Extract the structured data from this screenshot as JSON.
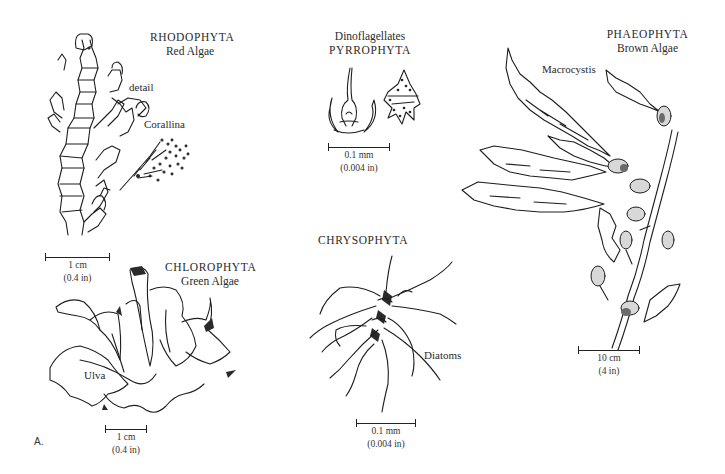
{
  "figure": {
    "panel_letter": "A.",
    "groups": [
      {
        "id": "rhodophyta",
        "division": "RHODOPHYTA",
        "common_name": "Red Algae",
        "annotations": [
          "detail",
          "Corallina"
        ],
        "scale_bar": {
          "metric": "1 cm",
          "imperial": "(0.4 in)"
        }
      },
      {
        "id": "pyrrophyta",
        "division": "PYRROPHYTA",
        "common_name": "Dinoflagellates",
        "annotations": [],
        "scale_bar": {
          "metric": "0.1 mm",
          "imperial": "(0.004 in)"
        }
      },
      {
        "id": "phaeophyta",
        "division": "PHAEOPHYTA",
        "common_name": "Brown Algae",
        "annotations": [
          "Macrocystis"
        ],
        "scale_bar": {
          "metric": "10 cm",
          "imperial": "(4 in)"
        }
      },
      {
        "id": "chlorophyta",
        "division": "CHLOROPHYTA",
        "common_name": "Green Algae",
        "annotations": [
          "Ulva"
        ],
        "scale_bar": {
          "metric": "1 cm",
          "imperial": "(0.4 in)"
        }
      },
      {
        "id": "chrysophyta",
        "division": "CHRYSOPHYTA",
        "common_name": "",
        "annotations": [
          "Diatoms"
        ],
        "scale_bar": {
          "metric": "0.1 mm",
          "imperial": "(0.004 in)"
        }
      }
    ]
  }
}
